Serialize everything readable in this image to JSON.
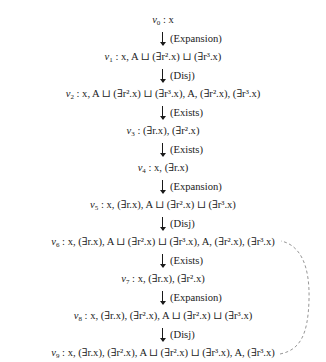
{
  "diagram": {
    "nodes": [
      {
        "id": "v0",
        "sub": "0",
        "label": " : x"
      },
      {
        "id": "v1",
        "sub": "1",
        "label": " : x, A ⊔ (∃r².x) ⊔ (∃r³.x)"
      },
      {
        "id": "v2",
        "sub": "2",
        "label": " : x, A ⊔ (∃r².x) ⊔ (∃r³.x), A, (∃r².x), (∃r³.x)"
      },
      {
        "id": "v3",
        "sub": "3",
        "label": " : (∃r.x), (∃r².x)"
      },
      {
        "id": "v4",
        "sub": "4",
        "label": " : x, (∃r.x)"
      },
      {
        "id": "v5",
        "sub": "5",
        "label": " : x, (∃r.x), A ⊔ (∃r².x) ⊔ (∃r³.x)"
      },
      {
        "id": "v6",
        "sub": "6",
        "label": " : x, (∃r.x), A ⊔ (∃r².x) ⊔ (∃r³.x), A, (∃r².x), (∃r³.x)"
      },
      {
        "id": "v7",
        "sub": "7",
        "label": " : x, (∃r.x), (∃r².x)"
      },
      {
        "id": "v8",
        "sub": "8",
        "label": " : x, (∃r.x), (∃r².x), A ⊔ (∃r².x) ⊔ (∃r³.x)"
      },
      {
        "id": "v9",
        "sub": "9",
        "label": " : x, (∃r.x), (∃r².x), A ⊔ (∃r².x) ⊔ (∃r³.x), A, (∃r³.x)"
      }
    ],
    "rules": [
      "(Expansion)",
      "(Disj)",
      "(Exists)",
      "(Exists)",
      "(Expansion)",
      "(Disj)",
      "(Exists)",
      "(Expansion)",
      "(Disj)"
    ],
    "back_edge": {
      "from": "v9",
      "to": "v6",
      "style": "dashed",
      "color": "#8a8a8a"
    }
  }
}
